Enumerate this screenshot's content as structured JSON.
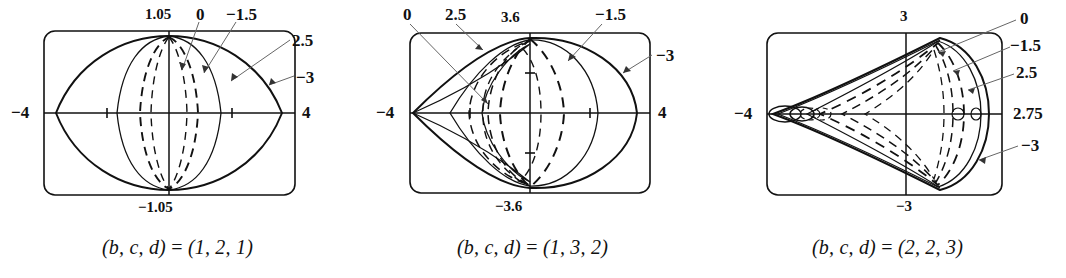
{
  "figure": {
    "type": "three-panel-parametric-curve-figure",
    "background": "#ffffff",
    "ink_color": "#111111",
    "leader_color": "#555555"
  },
  "panels": [
    {
      "id": "panel-0",
      "caption": "(b, c, d) = (1, 2, 1)",
      "caption_lhs": "(b, c, d)",
      "caption_rhs": "(1, 2, 1)",
      "axis_labels": {
        "left": "−4",
        "right": "4",
        "top": "1.05",
        "bottom": "−1.05"
      },
      "curve_labels": [
        {
          "text": "0",
          "x": 196,
          "y": 6
        },
        {
          "text": "−1.5",
          "x": 228,
          "y": 6
        },
        {
          "text": "2.5",
          "x": 292,
          "y": 32
        },
        {
          "text": "−3",
          "x": 296,
          "y": 69
        }
      ],
      "parameter_values": [
        0,
        -1.5,
        2.5,
        -3
      ],
      "x_range": [
        -4,
        4
      ],
      "y_range": [
        -1.05,
        1.05
      ]
    },
    {
      "id": "panel-1",
      "caption": "(b, c, d) = (1, 3, 2)",
      "caption_lhs": "(b, c, d)",
      "caption_rhs": "(1, 3, 2)",
      "axis_labels": {
        "left": "−4",
        "right": "4",
        "top": "3.6",
        "bottom": "−3.6"
      },
      "curve_labels": [
        {
          "text": "0",
          "x": 48,
          "y": 6
        },
        {
          "text": "2.5",
          "x": 92,
          "y": 6
        },
        {
          "text": "−1.5",
          "x": 243,
          "y": 6
        },
        {
          "text": "−3",
          "x": 300,
          "y": 48
        }
      ],
      "parameter_values": [
        0,
        2.5,
        -1.5,
        -3
      ],
      "x_range": [
        -4,
        4
      ],
      "y_range": [
        -3.6,
        3.6
      ]
    },
    {
      "id": "panel-2",
      "caption": "(b, c, d) = (2, 2, 3)",
      "caption_lhs": "(b, c, d)",
      "caption_rhs": "(2, 2, 3)",
      "axis_labels": {
        "left": "−4",
        "right": "2.75",
        "top": "3",
        "bottom": "−3"
      },
      "curve_labels": [
        {
          "text": "0",
          "x": 310,
          "y": 10
        },
        {
          "text": "−1.5",
          "x": 303,
          "y": 37
        },
        {
          "text": "2.5",
          "x": 307,
          "y": 64
        },
        {
          "text": "−3",
          "x": 311,
          "y": 137
        }
      ],
      "parameter_values": [
        0,
        -1.5,
        2.5,
        -3
      ],
      "x_range": [
        -4,
        4
      ],
      "y_range": [
        -3,
        3
      ]
    }
  ]
}
